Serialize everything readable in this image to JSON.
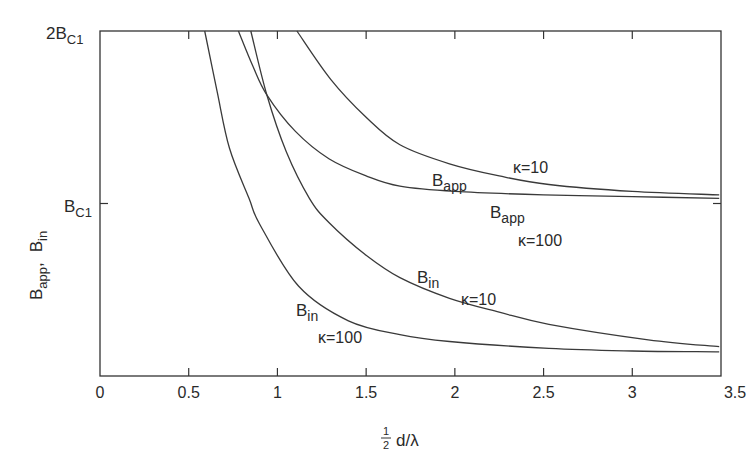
{
  "chart_data": {
    "type": "line",
    "title": "",
    "xlabel": "½ d/λ",
    "ylabel": "B_app, B_in",
    "xlim": [
      0,
      3.5
    ],
    "ylim": [
      0,
      2
    ],
    "x_ticks": [
      "0",
      "0.5",
      "1",
      "1.5",
      "2",
      "2.5",
      "3",
      "3.5"
    ],
    "x_tick_values": [
      0,
      0.5,
      1,
      1.5,
      2,
      2.5,
      3,
      3.5
    ],
    "y_ticks": [
      {
        "value": 1,
        "label": "B",
        "sub": "C1",
        "prefix": ""
      },
      {
        "value": 2,
        "label": "B",
        "sub": "C1",
        "prefix": "2"
      }
    ],
    "grid": false,
    "legend": "inline annotations",
    "series": [
      {
        "name": "B_app, κ=10",
        "points": [
          [
            1.11,
            2.0
          ],
          [
            1.3,
            1.72
          ],
          [
            1.5,
            1.5
          ],
          [
            1.69,
            1.34
          ],
          [
            1.97,
            1.23
          ],
          [
            2.25,
            1.16
          ],
          [
            2.53,
            1.11
          ],
          [
            3.0,
            1.07
          ],
          [
            3.49,
            1.05
          ]
        ]
      },
      {
        "name": "B_app, κ=100",
        "points": [
          [
            0.78,
            2.0
          ],
          [
            0.86,
            1.8
          ],
          [
            0.94,
            1.63
          ],
          [
            1.1,
            1.42
          ],
          [
            1.29,
            1.26
          ],
          [
            1.5,
            1.16
          ],
          [
            1.69,
            1.1
          ],
          [
            2.0,
            1.07
          ],
          [
            2.5,
            1.05
          ],
          [
            3.0,
            1.04
          ],
          [
            3.49,
            1.03
          ]
        ]
      },
      {
        "name": "B_in, κ=10",
        "points": [
          [
            0.85,
            2.0
          ],
          [
            0.94,
            1.63
          ],
          [
            1.05,
            1.3
          ],
          [
            1.18,
            1.03
          ],
          [
            1.29,
            0.89
          ],
          [
            1.5,
            0.7
          ],
          [
            1.69,
            0.57
          ],
          [
            1.97,
            0.45
          ],
          [
            2.25,
            0.37
          ],
          [
            2.53,
            0.3
          ],
          [
            3.09,
            0.21
          ],
          [
            3.49,
            0.17
          ]
        ]
      },
      {
        "name": "B_in, κ=100",
        "points": [
          [
            0.59,
            2.0
          ],
          [
            0.66,
            1.65
          ],
          [
            0.73,
            1.32
          ],
          [
            0.84,
            1.03
          ],
          [
            0.9,
            0.88
          ],
          [
            1.12,
            0.52
          ],
          [
            1.4,
            0.32
          ],
          [
            1.69,
            0.24
          ],
          [
            1.97,
            0.2
          ],
          [
            2.53,
            0.16
          ],
          [
            3.0,
            0.145
          ],
          [
            3.49,
            0.14
          ]
        ]
      }
    ],
    "annotations": [
      {
        "text": "B",
        "sub": "app",
        "target": "B_app, κ=10"
      },
      {
        "text": "κ=10",
        "target": "B_app, κ=10"
      },
      {
        "text": "B",
        "sub": "app",
        "target": "B_app, κ=100"
      },
      {
        "text": "κ=100",
        "target": "B_app, κ=100"
      },
      {
        "text": "B",
        "sub": "in",
        "target": "B_in, κ=10"
      },
      {
        "text": "κ=10",
        "target": "B_in, κ=10"
      },
      {
        "text": "B",
        "sub": "in",
        "target": "B_in, κ=100"
      },
      {
        "text": "κ=100",
        "target": "B_in, κ=100"
      }
    ]
  },
  "labels": {
    "y_top_prefix": "2B",
    "y_top_sub": "C1",
    "y_mid": "B",
    "y_mid_sub": "C1",
    "ylabel_a": "B",
    "ylabel_a_sub": "app",
    "ylabel_sep": ",",
    "ylabel_b": "B",
    "ylabel_b_sub": "in",
    "xlabel_frac_num": "1",
    "xlabel_frac_den": "2",
    "xlabel_rest": "d/λ",
    "ann": {
      "bapp10_B": "B",
      "bapp10_sub": "app",
      "bapp10_k": "κ=10",
      "bapp100_B": "B",
      "bapp100_sub": "app",
      "bapp100_k": "κ=100",
      "bin10_B": "B",
      "bin10_sub": "in",
      "bin10_k": "κ=10",
      "bin100_B": "B",
      "bin100_sub": "in",
      "bin100_k": "κ=100"
    }
  }
}
